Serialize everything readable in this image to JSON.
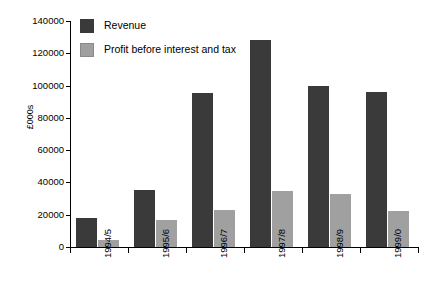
{
  "chart_data": {
    "type": "bar",
    "title": "",
    "xlabel": "",
    "ylabel": "£000s",
    "categories": [
      "1994/5",
      "1995/6",
      "1996/7",
      "1997/8",
      "1998/9",
      "1999/0"
    ],
    "series": [
      {
        "name": "Revenue",
        "color": "#3a3a3a",
        "values": [
          18000,
          35500,
          95500,
          128000,
          99500,
          96000
        ]
      },
      {
        "name": "Profit before interest and tax",
        "color": "#a0a0a0",
        "values": [
          4500,
          16500,
          23000,
          35000,
          33000,
          22500
        ]
      }
    ],
    "ylim": [
      0,
      140000
    ],
    "ytick_values": [
      0,
      20000,
      40000,
      60000,
      80000,
      100000,
      120000,
      140000
    ],
    "ytick_labels": [
      "0",
      "20000",
      "40000",
      "60000",
      "80000",
      "100000",
      "120000",
      "140000"
    ],
    "grid": false,
    "legend_position": "top-left",
    "xtick_rotation": -90
  },
  "legend": {
    "entries": [
      {
        "label": "Revenue"
      },
      {
        "label": "Profit before interest and tax"
      }
    ]
  },
  "axes": {
    "y_title": "£000s"
  }
}
